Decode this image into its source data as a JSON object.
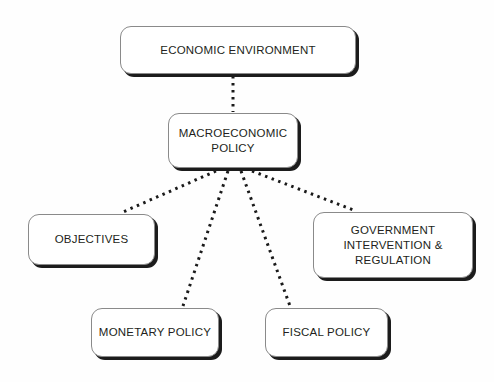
{
  "diagram": {
    "background_color": "#fefefe",
    "node_fill": "#ffffff",
    "node_border_color": "#8a8a8a",
    "node_shadow_color": "#1c1c1c",
    "text_color": "#231f20",
    "connector_color": "#1a1a1a",
    "connector_style": "dotted",
    "nodes": [
      {
        "id": "economic-environment",
        "label": "ECONOMIC ENVIRONMENT",
        "level": 0
      },
      {
        "id": "macroeconomic-policy",
        "label": "MACROECONOMIC\nPOLICY",
        "level": 1
      },
      {
        "id": "objectives",
        "label": "OBJECTIVES",
        "level": 2
      },
      {
        "id": "government-intervention",
        "label": "GOVERNMENT\nINTERVENTION &\nREGULATION",
        "level": 2
      },
      {
        "id": "monetary-policy",
        "label": "MONETARY POLICY",
        "level": 2
      },
      {
        "id": "fiscal-policy",
        "label": "FISCAL POLICY",
        "level": 2
      }
    ],
    "edges": [
      {
        "from": "economic-environment",
        "to": "macroeconomic-policy"
      },
      {
        "from": "macroeconomic-policy",
        "to": "objectives"
      },
      {
        "from": "macroeconomic-policy",
        "to": "monetary-policy"
      },
      {
        "from": "macroeconomic-policy",
        "to": "fiscal-policy"
      },
      {
        "from": "macroeconomic-policy",
        "to": "government-intervention"
      }
    ]
  }
}
